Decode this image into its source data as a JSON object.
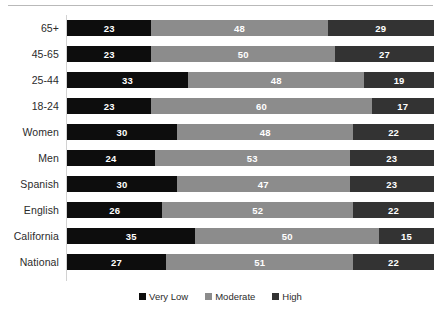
{
  "chart_data": {
    "type": "bar",
    "orientation": "horizontal",
    "stacked": true,
    "stack_mode": "percent",
    "title": "",
    "subtitle": "",
    "xlabel": "",
    "ylabel": "",
    "xlim": [
      0,
      100
    ],
    "grid": false,
    "legend_position": "bottom",
    "categories": [
      "65+",
      "45-65",
      "25-44",
      "18-24",
      "Women",
      "Men",
      "Spanish",
      "English",
      "California",
      "National"
    ],
    "series": [
      {
        "name": "Very Low",
        "color": "#0d0d0d",
        "values": [
          23,
          23,
          33,
          23,
          30,
          24,
          30,
          26,
          35,
          27
        ]
      },
      {
        "name": "Moderate",
        "color": "#8c8c8c",
        "values": [
          48,
          50,
          48,
          60,
          48,
          53,
          47,
          52,
          50,
          51
        ]
      },
      {
        "name": "High",
        "color": "#333333",
        "values": [
          29,
          27,
          19,
          17,
          22,
          23,
          23,
          22,
          15,
          22
        ]
      }
    ],
    "rows": [
      {
        "label": "65+",
        "segments": [
          23,
          48,
          29
        ]
      },
      {
        "label": "45-65",
        "segments": [
          23,
          50,
          27
        ]
      },
      {
        "label": "25-44",
        "segments": [
          33,
          48,
          19
        ]
      },
      {
        "label": "18-24",
        "segments": [
          23,
          60,
          17
        ]
      },
      {
        "label": "Women",
        "segments": [
          30,
          48,
          22
        ]
      },
      {
        "label": "Men",
        "segments": [
          24,
          53,
          23
        ]
      },
      {
        "label": "Spanish",
        "segments": [
          30,
          47,
          23
        ]
      },
      {
        "label": "English",
        "segments": [
          26,
          52,
          22
        ]
      },
      {
        "label": "California",
        "segments": [
          35,
          50,
          15
        ]
      },
      {
        "label": "National",
        "segments": [
          27,
          51,
          22
        ]
      }
    ],
    "legend": [
      {
        "label": "Very Low",
        "color": "#0d0d0d"
      },
      {
        "label": "Moderate",
        "color": "#8c8c8c"
      },
      {
        "label": "High",
        "color": "#333333"
      }
    ]
  },
  "style": {
    "background": "#ffffff",
    "label_color": "#2b2b2b",
    "value_color": "#ffffff",
    "rule_color": "#b9b9b9",
    "axis_color": "#d2d2d2"
  }
}
